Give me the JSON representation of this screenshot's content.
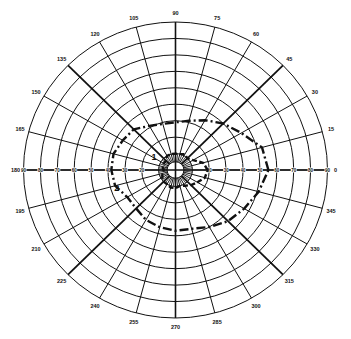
{
  "chart_data": {
    "type": "polar",
    "title": "",
    "angular_axis": {
      "unit": "degrees",
      "ticks": [
        0,
        15,
        30,
        45,
        60,
        75,
        90,
        105,
        120,
        135,
        150,
        165,
        180,
        195,
        210,
        225,
        240,
        255,
        270,
        285,
        300,
        315,
        330,
        345
      ],
      "tick_labels": [
        "0",
        "15",
        "30",
        "45",
        "60",
        "75",
        "90",
        "105",
        "120",
        "135",
        "150",
        "165",
        "180",
        "195",
        "210",
        "225",
        "240",
        "255",
        "270",
        "285",
        "300",
        "315",
        "330",
        "345"
      ],
      "emphasized": [
        45,
        135,
        225,
        315
      ]
    },
    "radial_axis": {
      "range": [
        0,
        90
      ],
      "rings": [
        10,
        20,
        30,
        40,
        50,
        60,
        70,
        80,
        90
      ],
      "ring_labels": [
        "10",
        "20",
        "30",
        "40",
        "50",
        "60",
        "70",
        "80",
        "90"
      ],
      "inner_spokes_every_deg": 15,
      "center_circle": 5
    },
    "grid": true,
    "series": [
      {
        "name": "1",
        "style": "dashed",
        "label_position": {
          "angle": 155,
          "r": 14
        },
        "angles": [
          0,
          15,
          30,
          45,
          60,
          75,
          90,
          105,
          120,
          135,
          150,
          165,
          180,
          195,
          210,
          225,
          240,
          255,
          270,
          285,
          300,
          315,
          330,
          345
        ],
        "values": [
          19,
          17,
          12,
          10,
          11,
          10,
          10,
          10,
          10,
          8,
          8,
          8,
          7,
          8,
          9,
          10,
          10,
          11,
          11,
          10,
          11,
          13,
          15,
          18
        ]
      },
      {
        "name": "2",
        "style": "dash-dot",
        "label_position": {
          "angle": 200,
          "r": 37
        },
        "angles": [
          0,
          15,
          30,
          45,
          60,
          75,
          90,
          105,
          120,
          135,
          150,
          165,
          180,
          195,
          210,
          225,
          240,
          255,
          270,
          285,
          300,
          315,
          330,
          345
        ],
        "values": [
          55,
          53,
          45,
          40,
          35,
          31,
          29,
          29,
          31,
          35,
          36,
          38,
          38,
          37,
          33,
          33,
          35,
          36,
          37,
          37,
          40,
          44,
          47,
          51
        ]
      }
    ],
    "annotations": [
      "1",
      "2"
    ]
  },
  "colors": {
    "grid": "#111111",
    "series": "#111111",
    "background": "#ffffff"
  }
}
